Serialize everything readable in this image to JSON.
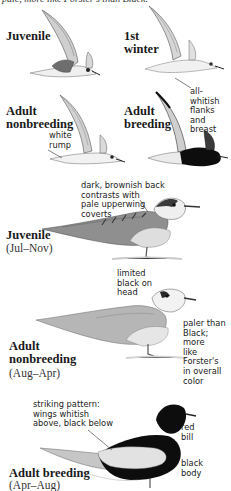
{
  "caption_top": "pale, more like Forster's than Black.",
  "flight_birds": [
    {
      "label": "Juvenile"
    },
    {
      "label_line1": "1st",
      "label_line2": "winter",
      "note": [
        "all-whitish",
        "flanks and",
        "breast"
      ]
    },
    {
      "label_line1": "Adult",
      "label_line2": "nonbreeding",
      "note": [
        "white",
        "rump"
      ]
    },
    {
      "label_line1": "Adult",
      "label_line2": "breeding"
    }
  ],
  "standing_birds": [
    {
      "label": "Juvenile",
      "season": "(Jul–Nov)",
      "note": [
        "dark, brownish back",
        "contrasts with",
        "pale upperwing",
        "coverts"
      ]
    },
    {
      "label_line1": "Adult",
      "label_line2": "nonbreeding",
      "season": "(Aug–Apr)",
      "notes": {
        "head": [
          "limited",
          "black on",
          "head"
        ],
        "color": [
          "paler than",
          "Black; more",
          "like Forster's",
          "in overall",
          "color"
        ]
      }
    },
    {
      "label": "Adult breeding",
      "season": "(Apr–Aug)",
      "notes": {
        "wings": [
          "striking pattern:",
          "wings whitish",
          "above, black below"
        ],
        "bill": [
          "red",
          "bill"
        ],
        "body": [
          "black",
          "body"
        ]
      }
    }
  ],
  "colors": {
    "ink": "#1a1a1a",
    "wing_gray": "#b9b9b9",
    "body_pale": "#e4e4e4",
    "black_body": "#0d0d0d"
  }
}
